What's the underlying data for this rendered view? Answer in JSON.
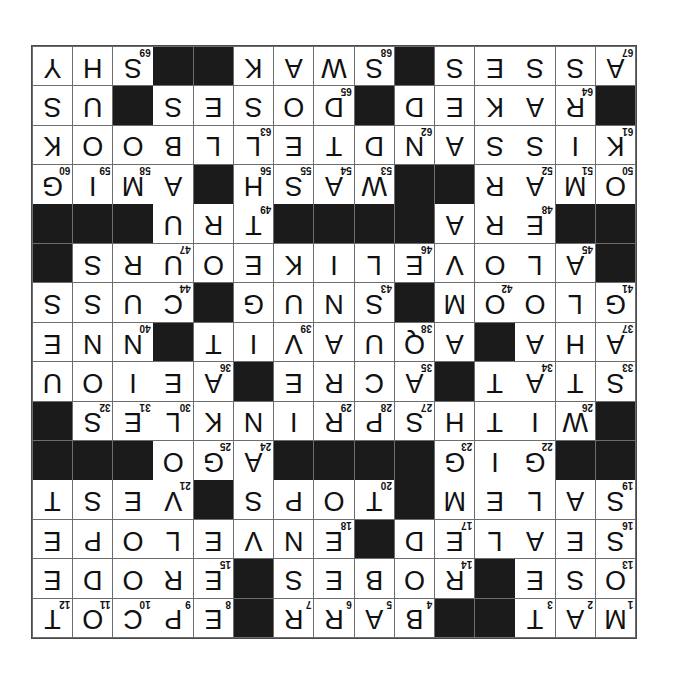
{
  "page": {
    "background_color": "#ffffff"
  },
  "puzzle": {
    "rotation_degrees": 180,
    "rows": 15,
    "cols": 15,
    "block_color": "#1b1b1b",
    "cell_color": "#ffffff",
    "grid_line_color": "#6d6d6d",
    "letter_color": "#111111",
    "number_color": "#111111",
    "grid": [
      [
        "M",
        "A",
        "T",
        "",
        "",
        "B",
        "A",
        "R",
        "R",
        "",
        "E",
        "P",
        "C",
        "O",
        "T"
      ],
      [
        "O",
        "S",
        "E",
        "",
        "R",
        "O",
        "B",
        "E",
        "S",
        "",
        "E",
        "R",
        "O",
        "D",
        "E"
      ],
      [
        "S",
        "E",
        "A",
        "L",
        "E",
        "D",
        "",
        "E",
        "N",
        "V",
        "E",
        "L",
        "O",
        "P",
        "E"
      ],
      [
        "S",
        "A",
        "L",
        "E",
        "M",
        "",
        "T",
        "O",
        "P",
        "S",
        "",
        "V",
        "E",
        "S",
        "T"
      ],
      [
        "",
        "",
        "G",
        "I",
        "G",
        "",
        "",
        "",
        "",
        "A",
        "G",
        "O",
        "",
        "",
        ""
      ],
      [
        "",
        "W",
        "I",
        "T",
        "H",
        "S",
        "P",
        "R",
        "I",
        "N",
        "K",
        "L",
        "E",
        "S",
        ""
      ],
      [
        "S",
        "T",
        "A",
        "T",
        "",
        "A",
        "C",
        "R",
        "E",
        "",
        "A",
        "E",
        "I",
        "O",
        "U"
      ],
      [
        "A",
        "H",
        "A",
        "",
        "A",
        "Q",
        "U",
        "A",
        "V",
        "I",
        "T",
        "",
        "N",
        "N",
        "E"
      ],
      [
        "G",
        "L",
        "O",
        "O",
        "M",
        "",
        "S",
        "N",
        "U",
        "G",
        "",
        "C",
        "U",
        "S",
        "S"
      ],
      [
        "",
        "A",
        "L",
        "O",
        "V",
        "E",
        "L",
        "I",
        "K",
        "E",
        "O",
        "U",
        "R",
        "S",
        ""
      ],
      [
        "",
        "",
        "E",
        "R",
        "A",
        "",
        "",
        "",
        "",
        "T",
        "R",
        "U",
        "",
        "",
        ""
      ],
      [
        "O",
        "M",
        "A",
        "R",
        "",
        "",
        "W",
        "A",
        "S",
        "H",
        "",
        "A",
        "M",
        "I",
        "G",
        "O"
      ],
      [
        "K",
        "I",
        "S",
        "S",
        "A",
        "N",
        "D",
        "T",
        "E",
        "L",
        "L",
        "B",
        "O",
        "O",
        "K"
      ],
      [
        "",
        "R",
        "A",
        "K",
        "E",
        "D",
        "",
        "D",
        "O",
        "S",
        "E",
        "S",
        "",
        "U",
        "S",
        "A"
      ],
      [
        "A",
        "S",
        "S",
        "E",
        "S",
        "",
        "S",
        "W",
        "A",
        "K",
        "",
        "",
        "S",
        "H",
        "Y"
      ]
    ],
    "numbers": [
      {
        "row": 0,
        "col": 0,
        "n": "1"
      },
      {
        "row": 0,
        "col": 1,
        "n": "2"
      },
      {
        "row": 0,
        "col": 2,
        "n": "3"
      },
      {
        "row": 0,
        "col": 5,
        "n": "4"
      },
      {
        "row": 0,
        "col": 6,
        "n": "5"
      },
      {
        "row": 0,
        "col": 7,
        "n": "6"
      },
      {
        "row": 0,
        "col": 8,
        "n": "7"
      },
      {
        "row": 0,
        "col": 10,
        "n": "8"
      },
      {
        "row": 0,
        "col": 11,
        "n": "9"
      },
      {
        "row": 0,
        "col": 12,
        "n": "10"
      },
      {
        "row": 0,
        "col": 13,
        "n": "11"
      },
      {
        "row": 0,
        "col": 14,
        "n": "12"
      },
      {
        "row": 1,
        "col": 0,
        "n": "13"
      },
      {
        "row": 1,
        "col": 4,
        "n": "14"
      },
      {
        "row": 1,
        "col": 10,
        "n": "15"
      },
      {
        "row": 2,
        "col": 0,
        "n": "16"
      },
      {
        "row": 2,
        "col": 4,
        "n": "17"
      },
      {
        "row": 2,
        "col": 7,
        "n": "18"
      },
      {
        "row": 3,
        "col": 0,
        "n": "19"
      },
      {
        "row": 3,
        "col": 6,
        "n": "20"
      },
      {
        "row": 3,
        "col": 11,
        "n": "21"
      },
      {
        "row": 4,
        "col": 2,
        "n": "22"
      },
      {
        "row": 4,
        "col": 4,
        "n": "23"
      },
      {
        "row": 4,
        "col": 9,
        "n": "24"
      },
      {
        "row": 4,
        "col": 10,
        "n": "25"
      },
      {
        "row": 5,
        "col": 1,
        "n": "26"
      },
      {
        "row": 5,
        "col": 5,
        "n": "27"
      },
      {
        "row": 5,
        "col": 6,
        "n": "28"
      },
      {
        "row": 5,
        "col": 7,
        "n": "29"
      },
      {
        "row": 5,
        "col": 11,
        "n": "30"
      },
      {
        "row": 5,
        "col": 12,
        "n": "31"
      },
      {
        "row": 5,
        "col": 13,
        "n": "32"
      },
      {
        "row": 6,
        "col": 0,
        "n": "33"
      },
      {
        "row": 6,
        "col": 2,
        "n": "34"
      },
      {
        "row": 6,
        "col": 5,
        "n": "35"
      },
      {
        "row": 6,
        "col": 10,
        "n": "36"
      },
      {
        "row": 7,
        "col": 0,
        "n": "37"
      },
      {
        "row": 7,
        "col": 5,
        "n": "38"
      },
      {
        "row": 7,
        "col": 8,
        "n": "39"
      },
      {
        "row": 7,
        "col": 12,
        "n": "40"
      },
      {
        "row": 8,
        "col": 0,
        "n": "41"
      },
      {
        "row": 8,
        "col": 3,
        "n": "42"
      },
      {
        "row": 8,
        "col": 6,
        "n": "43"
      },
      {
        "row": 8,
        "col": 11,
        "n": "44"
      },
      {
        "row": 9,
        "col": 1,
        "n": "45"
      },
      {
        "row": 9,
        "col": 5,
        "n": "46"
      },
      {
        "row": 9,
        "col": 11,
        "n": "47"
      },
      {
        "row": 10,
        "col": 2,
        "n": "48"
      },
      {
        "row": 10,
        "col": 9,
        "n": "49"
      },
      {
        "row": 11,
        "col": 0,
        "n": "50"
      },
      {
        "row": 11,
        "col": 1,
        "n": "51"
      },
      {
        "row": 11,
        "col": 2,
        "n": "52"
      },
      {
        "row": 11,
        "col": 6,
        "n": "53"
      },
      {
        "row": 11,
        "col": 7,
        "n": "54"
      },
      {
        "row": 11,
        "col": 8,
        "n": "55"
      },
      {
        "row": 11,
        "col": 9,
        "n": "56"
      },
      {
        "row": 11,
        "col": 10,
        "n": "57"
      },
      {
        "row": 11,
        "col": 12,
        "n": "58"
      },
      {
        "row": 11,
        "col": 13,
        "n": "59"
      },
      {
        "row": 11,
        "col": 14,
        "n": "60"
      },
      {
        "row": 12,
        "col": 0,
        "n": "61"
      },
      {
        "row": 12,
        "col": 5,
        "n": "62"
      },
      {
        "row": 12,
        "col": 9,
        "n": "63"
      },
      {
        "row": 13,
        "col": 1,
        "n": "64"
      },
      {
        "row": 13,
        "col": 7,
        "n": "65"
      },
      {
        "row": 13,
        "col": 12,
        "n": "66"
      },
      {
        "row": 14,
        "col": 0,
        "n": "67"
      },
      {
        "row": 14,
        "col": 6,
        "n": "68"
      },
      {
        "row": 14,
        "col": 12,
        "n": "69"
      }
    ]
  }
}
